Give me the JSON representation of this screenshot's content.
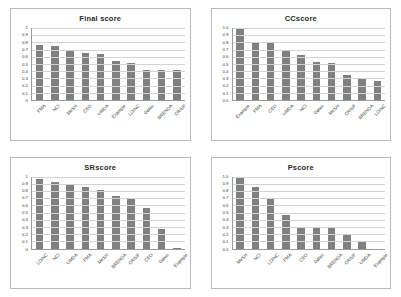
{
  "chart_data": [
    {
      "type": "bar",
      "title": "Final score",
      "xlabel": "",
      "ylabel": "",
      "ylim": [
        0,
        1
      ],
      "yticks": [
        "1",
        "0.9",
        "0.8",
        "0.7",
        "0.6",
        "0.5",
        "0.4",
        "0.3",
        "0.2",
        "0.1",
        "0"
      ],
      "grid": true,
      "legend": "none",
      "categories": [
        "FMA",
        "NCI",
        "MeSH",
        "CEO",
        "UMDA",
        "Example",
        "LOINC",
        "Galen",
        "BRENDA",
        "CRISP"
      ],
      "values": [
        0.76,
        0.75,
        0.68,
        0.65,
        0.64,
        0.54,
        0.52,
        0.42,
        0.41,
        0.41
      ]
    },
    {
      "type": "bar",
      "title": "CCscore",
      "xlabel": "",
      "ylabel": "",
      "ylim": [
        0,
        1
      ],
      "yticks": [
        "1.0",
        "0.9",
        "0.8",
        "0.7",
        "0.6",
        "0.5",
        "0.4",
        "0.3",
        "0.2",
        "0.1",
        "0.0"
      ],
      "grid": true,
      "legend": "none",
      "categories": [
        "Example",
        "FMA",
        "CEO",
        "UMDA",
        "NCI",
        "Galen",
        "MeSH",
        "CRISP",
        "BRENDA",
        "LOINC"
      ],
      "values": [
        1.0,
        0.81,
        0.81,
        0.7,
        0.63,
        0.53,
        0.51,
        0.35,
        0.3,
        0.26
      ]
    },
    {
      "type": "bar",
      "title": "SRscore",
      "xlabel": "",
      "ylabel": "",
      "ylim": [
        0,
        1
      ],
      "yticks": [
        "1",
        "0.9",
        "0.8",
        "0.7",
        "0.6",
        "0.5",
        "0.4",
        "0.3",
        "0.2",
        "0.1",
        "0"
      ],
      "grid": true,
      "legend": "none",
      "categories": [
        "LOINC",
        "NCI",
        "UMDA",
        "FMA",
        "MeSH",
        "BRENDA",
        "CRISP",
        "CEO",
        "Galen",
        "Example"
      ],
      "values": [
        0.96,
        0.93,
        0.88,
        0.86,
        0.81,
        0.73,
        0.69,
        0.56,
        0.27,
        0.01
      ]
    },
    {
      "type": "bar",
      "title": "Pscore",
      "xlabel": "",
      "ylabel": "",
      "ylim": [
        0,
        1
      ],
      "yticks": [
        "1.0",
        "0.9",
        "0.8",
        "0.7",
        "0.6",
        "0.5",
        "0.4",
        "0.3",
        "0.2",
        "0.1",
        "0.0"
      ],
      "grid": true,
      "legend": "none",
      "categories": [
        "MeSH",
        "NCI",
        "LOINC",
        "FMA",
        "CEO",
        "Galen",
        "BRENDA",
        "CRISP",
        "UMDA",
        "Example"
      ],
      "values": [
        1.0,
        0.86,
        0.69,
        0.47,
        0.28,
        0.28,
        0.28,
        0.19,
        0.1,
        0.0
      ]
    }
  ],
  "style": {
    "bar_color": "#808080",
    "gridline_color": "#d3d3d3",
    "axis_color": "#9a9a9a",
    "panel_border": "#b9b9b9",
    "background": "#ffffff"
  }
}
